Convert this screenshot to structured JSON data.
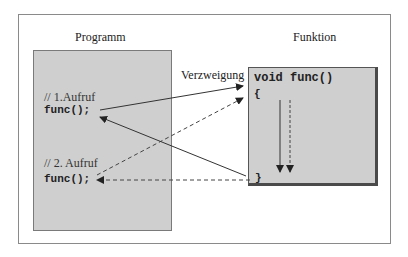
{
  "diagram": {
    "program_title": "Programm",
    "function_title": "Funktion",
    "branch_label": "Verzweigung",
    "program": {
      "comment1": "// 1.Aufruf",
      "call1": "func();",
      "comment2": "// 2. Aufruf",
      "call2": "func();"
    },
    "function": {
      "signature": "void func()",
      "open_brace": "{",
      "close_brace": "}"
    },
    "colors": {
      "box_fill": "#cfcfcf",
      "line": "#333333"
    }
  }
}
